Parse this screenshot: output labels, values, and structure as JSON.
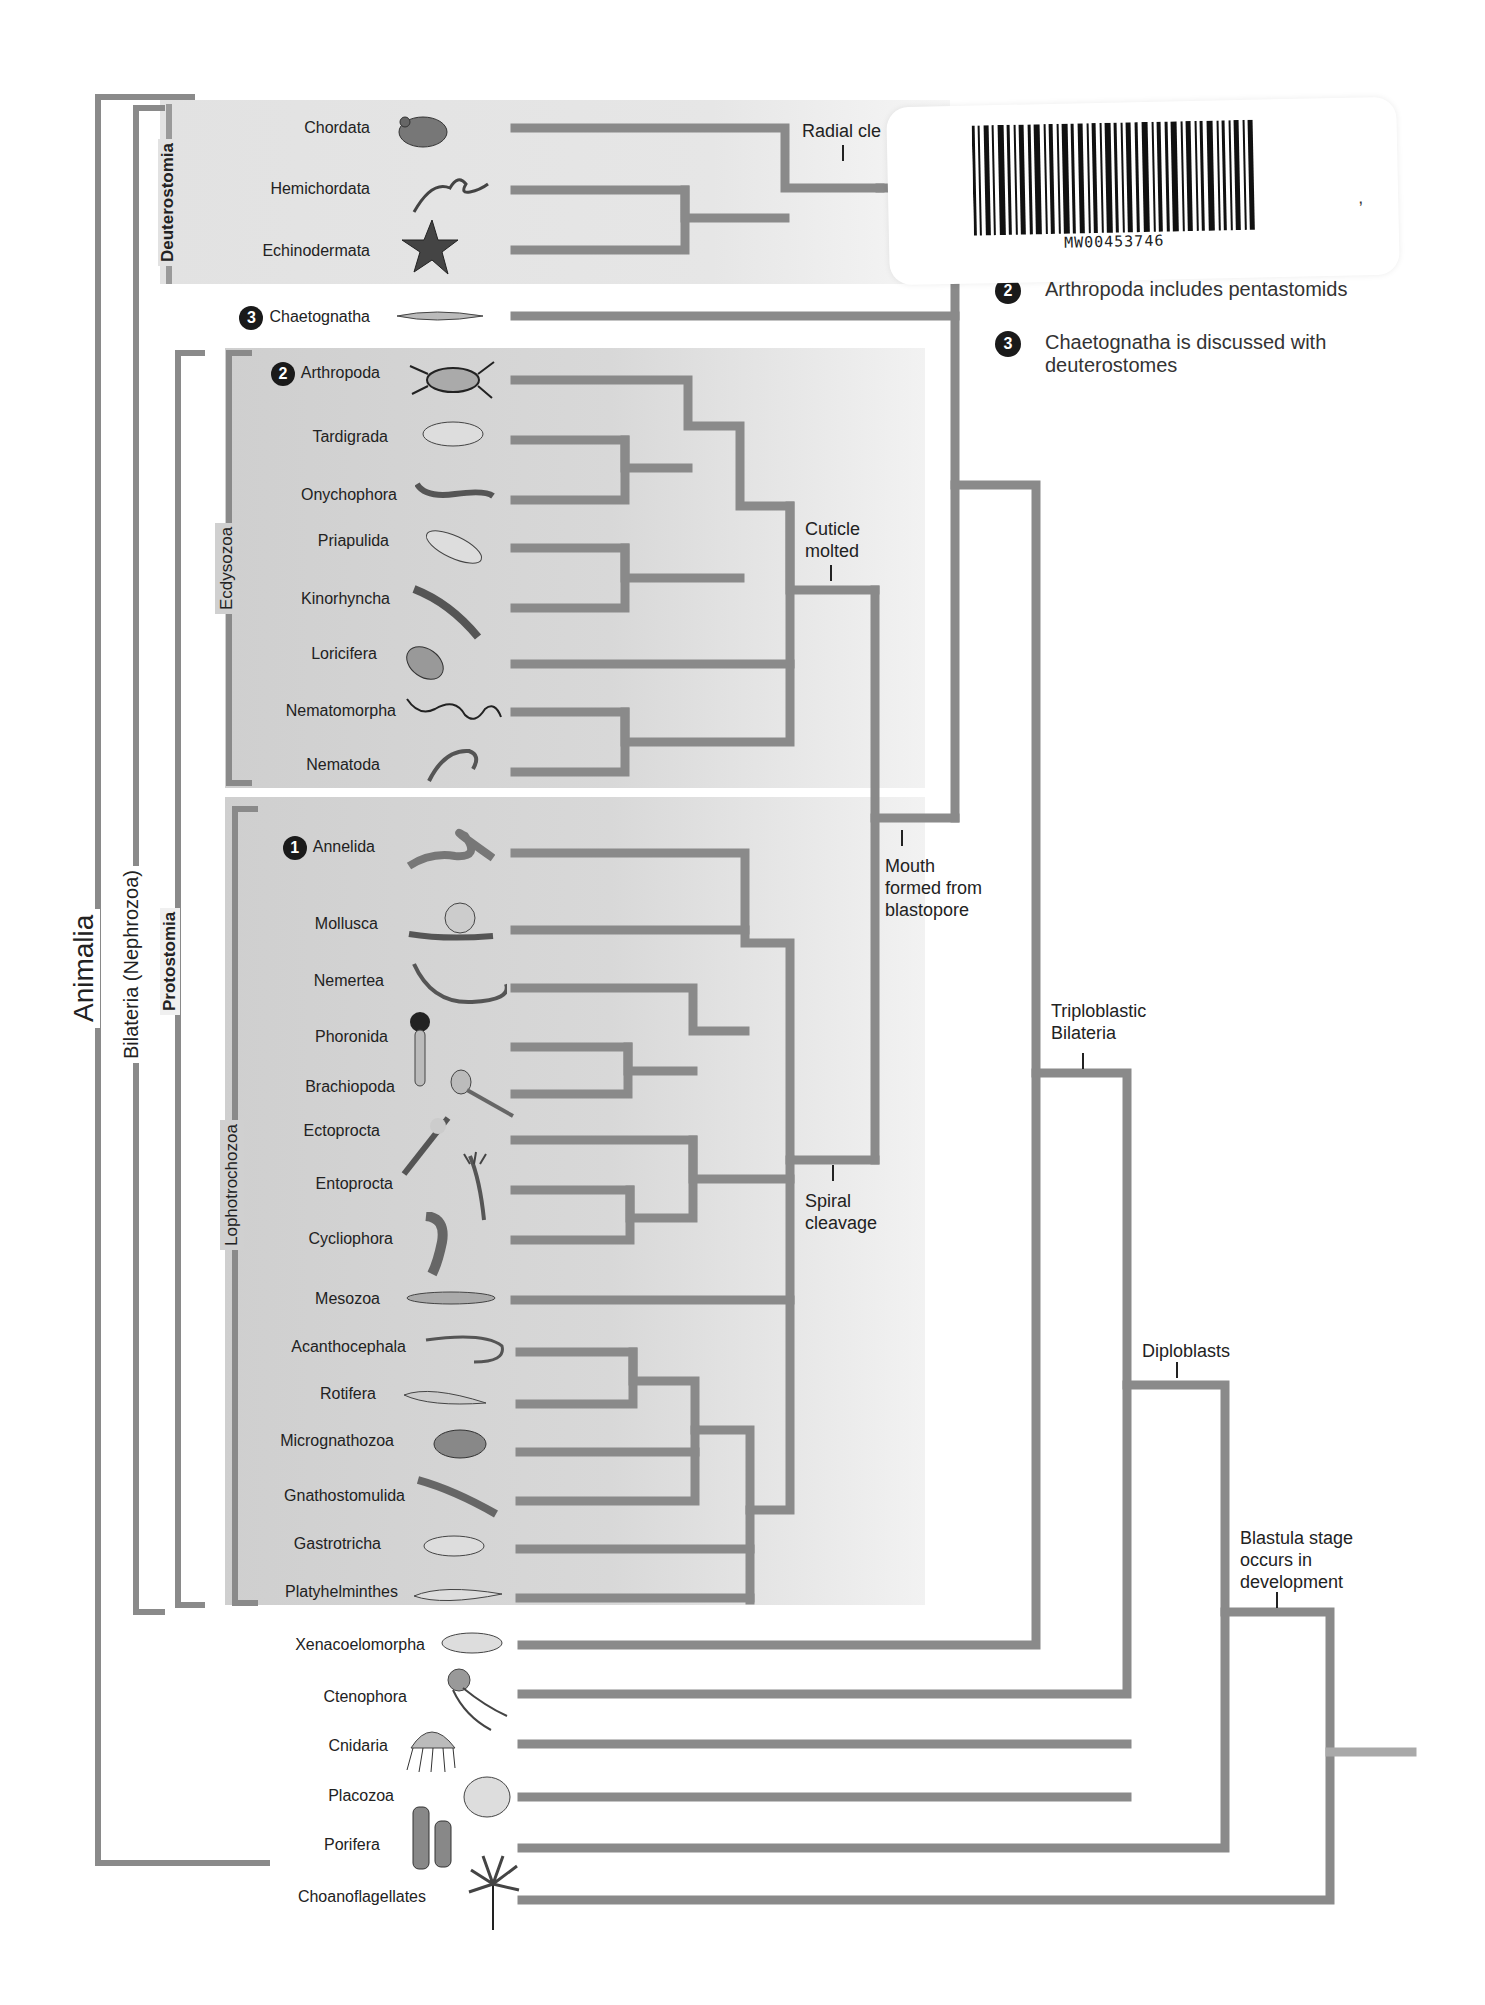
{
  "groups": {
    "animalia": "Animalia",
    "bilateria": "Bilateria (Nephrozoa)",
    "protostomia": "Protostomia",
    "deuterostomia": "Deuterostomia",
    "ecdysozoa": "Ecdysozoa",
    "lophotrochozoa": "Lophotrochozoa"
  },
  "taxa": {
    "deuterostomia": [
      "Chordata",
      "Hemichordata",
      "Echinodermata"
    ],
    "chaetognatha": {
      "label": "Chaetognatha",
      "badge": "3"
    },
    "ecdysozoa": [
      {
        "label": "Arthropoda",
        "badge": "2"
      },
      {
        "label": "Tardigrada"
      },
      {
        "label": "Onychophora"
      },
      {
        "label": "Priapulida"
      },
      {
        "label": "Kinorhyncha"
      },
      {
        "label": "Loricifera"
      },
      {
        "label": "Nematomorpha"
      },
      {
        "label": "Nematoda"
      }
    ],
    "lophotrochozoa": [
      {
        "label": "Annelida",
        "badge": "1"
      },
      {
        "label": "Mollusca"
      },
      {
        "label": "Nemertea"
      },
      {
        "label": "Phoronida"
      },
      {
        "label": "Brachiopoda"
      },
      {
        "label": "Ectoprocta"
      },
      {
        "label": "Entoprocta"
      },
      {
        "label": "Cycliophora"
      },
      {
        "label": "Mesozoa"
      },
      {
        "label": "Acanthocephala"
      },
      {
        "label": "Rotifera"
      },
      {
        "label": "Micrognathozoa"
      },
      {
        "label": "Gnathostomulida"
      },
      {
        "label": "Gastrotricha"
      },
      {
        "label": "Platyhelminthes"
      }
    ],
    "basal": [
      "Xenacoelomorpha",
      "Ctenophora",
      "Cnidaria",
      "Placozoa",
      "Porifera",
      "Choanoflagellates"
    ]
  },
  "node_labels": {
    "radial_cleavage": "Radial cle",
    "cuticle_molted": [
      "Cuticle",
      "molted"
    ],
    "mouth_blastopore": [
      "Mouth",
      "formed from",
      "blastopore"
    ],
    "spiral_cleavage": [
      "Spiral",
      "cleavage"
    ],
    "triploblastic": [
      "Triploblastic",
      "Bilateria"
    ],
    "diploblasts": "Diploblasts",
    "blastula": [
      "Blastula stage",
      "occurs in",
      "development"
    ]
  },
  "legend": [
    {
      "badge": "2",
      "text": "Arthropoda includes pentastomids"
    },
    {
      "badge": "3",
      "text": "Chaetognatha is discussed with",
      "text2": "deuterostomes"
    }
  ],
  "sticker": {
    "barcode_text": "MW00453746",
    "partial_char": ","
  },
  "colors": {
    "branch": "#8a8a8a",
    "panel": "#d4d4d4",
    "text": "#222222",
    "badge": "#1a1a1a"
  }
}
